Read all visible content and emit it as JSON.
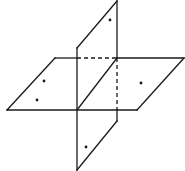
{
  "diagram": {
    "title": "",
    "colors": {
      "stroke": "#1a1a1a",
      "background": "#ffffff"
    },
    "planes": [
      {
        "name": "horizontal-plane",
        "vertices": [
          [
            55,
            58
          ],
          [
            184,
            58
          ],
          [
            137,
            110
          ],
          [
            7,
            110
          ]
        ]
      },
      {
        "name": "vertical-plane",
        "vertices": [
          [
            117,
            1
          ],
          [
            117,
            121
          ],
          [
            77,
            170
          ],
          [
            77,
            48
          ]
        ]
      }
    ],
    "hidden_edges": [
      {
        "from": [
          77,
          58
        ],
        "to": [
          117,
          58
        ]
      },
      {
        "from": [
          117,
          58
        ],
        "to": [
          117,
          110
        ]
      }
    ],
    "intersection_line": {
      "from": [
        117,
        58
      ],
      "to": [
        77,
        110
      ]
    },
    "points": [
      {
        "x": 110,
        "y": 20
      },
      {
        "x": 44,
        "y": 81
      },
      {
        "x": 37,
        "y": 100
      },
      {
        "x": 141,
        "y": 83
      },
      {
        "x": 86,
        "y": 147
      }
    ]
  }
}
